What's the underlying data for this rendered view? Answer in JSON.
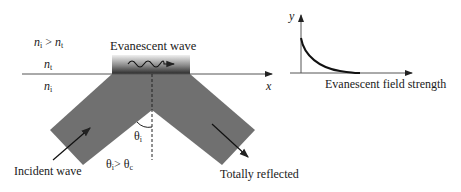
{
  "diagram": {
    "media_condition": {
      "left": "n",
      "left_sub": "i",
      "op": " > ",
      "right": "n",
      "right_sub": "t"
    },
    "upper_medium": {
      "sym": "n",
      "sub": "t"
    },
    "lower_medium": {
      "sym": "n",
      "sub": "i"
    },
    "evanescent_label": "Evanescent wave",
    "x_axis_label": "x",
    "angle_label": {
      "sym": "θ",
      "sub": "i"
    },
    "condition": {
      "left": "θ",
      "left_sub": "i",
      "op": "> ",
      "right": "θ",
      "right_sub": "c"
    },
    "incident_label": "Incident wave",
    "reflected_label": "Totally reflected"
  },
  "inset": {
    "y_axis_label": "y",
    "caption": "Evanescent field strength"
  },
  "colors": {
    "band": "#6e6e6e",
    "line": "#333333",
    "gradient_top": "#e0e0e0",
    "gradient_bottom": "#2a2a2a"
  }
}
